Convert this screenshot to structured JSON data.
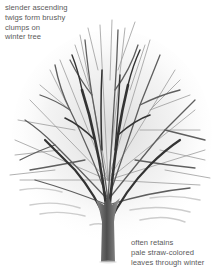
{
  "illustration": {
    "subject": "winter-tree",
    "colors": {
      "background": "#ffffff",
      "branch_dark": "#2e2e2e",
      "branch_mid": "#6a6a6a",
      "branch_light": "#a8a8a8",
      "trunk": "#5c5c5c",
      "text": "#5a5a5a"
    }
  },
  "annotations": {
    "top_left": {
      "lines": [
        "slender ascending",
        "twigs form brushy",
        "clumps on",
        "winter tree"
      ]
    },
    "bottom_right": {
      "lines": [
        "often retains",
        "pale straw-colored",
        "leaves through winter"
      ]
    }
  }
}
